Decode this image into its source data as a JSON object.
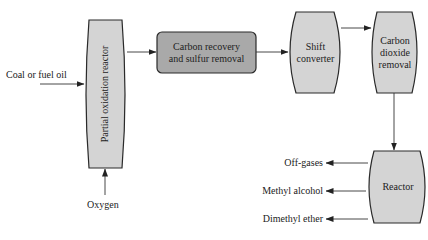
{
  "colors": {
    "node_fill_light": "#d4d4d4",
    "node_fill_dark": "#a9a9a9",
    "stroke": "#2a2a2a",
    "arrow": "#333333"
  },
  "nodes": {
    "partial_oxidation": {
      "label": "Partial oxidation reactor",
      "shape": "barrel-vertical"
    },
    "carbon_recovery": {
      "line1": "Carbon recovery",
      "line2": "and sulfur removal",
      "shape": "rounded-rect"
    },
    "shift_converter": {
      "line1": "Shift",
      "line2": "converter",
      "shape": "barrel"
    },
    "co2_removal": {
      "line1": "Carbon",
      "line2": "dioxide",
      "line3": "removal",
      "shape": "barrel"
    },
    "reactor": {
      "label": "Reactor",
      "shape": "barrel"
    }
  },
  "inputs": {
    "feed": "Coal or fuel oil",
    "oxidant": "Oxygen"
  },
  "outputs": [
    {
      "label": "Off-gases"
    },
    {
      "label": "Methyl alcohol"
    },
    {
      "label": "Dimethyl ether"
    }
  ],
  "edges": [
    {
      "from": "Coal or fuel oil",
      "to": "Partial oxidation reactor"
    },
    {
      "from": "Oxygen",
      "to": "Partial oxidation reactor"
    },
    {
      "from": "Partial oxidation reactor",
      "to": "Carbon recovery and sulfur removal"
    },
    {
      "from": "Carbon recovery and sulfur removal",
      "to": "Shift converter"
    },
    {
      "from": "Shift converter",
      "to": "Carbon dioxide removal"
    },
    {
      "from": "Carbon dioxide removal",
      "to": "Reactor"
    },
    {
      "from": "Reactor",
      "to": "Off-gases"
    },
    {
      "from": "Reactor",
      "to": "Methyl alcohol"
    },
    {
      "from": "Reactor",
      "to": "Dimethyl ether"
    }
  ]
}
